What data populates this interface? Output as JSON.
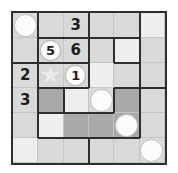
{
  "puzzle": {
    "title": "6x6 region grid puzzle",
    "columns": 6,
    "rows": 6,
    "cell_size": 26,
    "colors": {
      "border": "#2e2e2e",
      "gridline": "#c5c5c5",
      "cell_light": "#d9d9d9",
      "cell_pale": "#eeeeee",
      "cell_dark": "#a9a9a9",
      "piece": "#fbfbfb",
      "text": "#1d1d1d"
    },
    "cells": [
      {
        "r": 1,
        "c": 1,
        "fill": "light",
        "piece": "stone",
        "value": ""
      },
      {
        "r": 1,
        "c": 2,
        "fill": "light",
        "piece": "none",
        "value": ""
      },
      {
        "r": 1,
        "c": 3,
        "fill": "light",
        "piece": "none",
        "value": "3"
      },
      {
        "r": 1,
        "c": 4,
        "fill": "light",
        "piece": "none",
        "value": ""
      },
      {
        "r": 1,
        "c": 5,
        "fill": "light",
        "piece": "none",
        "value": ""
      },
      {
        "r": 1,
        "c": 6,
        "fill": "pale",
        "piece": "none",
        "value": ""
      },
      {
        "r": 2,
        "c": 1,
        "fill": "light",
        "piece": "none",
        "value": ""
      },
      {
        "r": 2,
        "c": 2,
        "fill": "light",
        "piece": "circle-number",
        "value": "5"
      },
      {
        "r": 2,
        "c": 3,
        "fill": "light",
        "piece": "none",
        "value": "6"
      },
      {
        "r": 2,
        "c": 4,
        "fill": "light",
        "piece": "none",
        "value": ""
      },
      {
        "r": 2,
        "c": 5,
        "fill": "pale",
        "piece": "none",
        "value": ""
      },
      {
        "r": 2,
        "c": 6,
        "fill": "light",
        "piece": "none",
        "value": ""
      },
      {
        "r": 3,
        "c": 1,
        "fill": "light",
        "piece": "none",
        "value": "2"
      },
      {
        "r": 3,
        "c": 2,
        "fill": "light",
        "piece": "star",
        "value": ""
      },
      {
        "r": 3,
        "c": 3,
        "fill": "light",
        "piece": "circle-number",
        "value": "1"
      },
      {
        "r": 3,
        "c": 4,
        "fill": "pale",
        "piece": "none",
        "value": ""
      },
      {
        "r": 3,
        "c": 5,
        "fill": "light",
        "piece": "none",
        "value": ""
      },
      {
        "r": 3,
        "c": 6,
        "fill": "light",
        "piece": "none",
        "value": ""
      },
      {
        "r": 4,
        "c": 1,
        "fill": "light",
        "piece": "none",
        "value": "3"
      },
      {
        "r": 4,
        "c": 2,
        "fill": "dark",
        "piece": "none",
        "value": ""
      },
      {
        "r": 4,
        "c": 3,
        "fill": "pale",
        "piece": "none",
        "value": ""
      },
      {
        "r": 4,
        "c": 4,
        "fill": "light",
        "piece": "stone",
        "value": ""
      },
      {
        "r": 4,
        "c": 5,
        "fill": "dark",
        "piece": "none",
        "value": ""
      },
      {
        "r": 4,
        "c": 6,
        "fill": "light",
        "piece": "none",
        "value": ""
      },
      {
        "r": 5,
        "c": 1,
        "fill": "light",
        "piece": "none",
        "value": ""
      },
      {
        "r": 5,
        "c": 2,
        "fill": "pale",
        "piece": "none",
        "value": ""
      },
      {
        "r": 5,
        "c": 3,
        "fill": "dark",
        "piece": "none",
        "value": ""
      },
      {
        "r": 5,
        "c": 4,
        "fill": "dark",
        "piece": "none",
        "value": ""
      },
      {
        "r": 5,
        "c": 5,
        "fill": "dark",
        "piece": "stone",
        "value": ""
      },
      {
        "r": 5,
        "c": 6,
        "fill": "light",
        "piece": "none",
        "value": ""
      },
      {
        "r": 6,
        "c": 1,
        "fill": "pale",
        "piece": "none",
        "value": ""
      },
      {
        "r": 6,
        "c": 2,
        "fill": "light",
        "piece": "none",
        "value": ""
      },
      {
        "r": 6,
        "c": 3,
        "fill": "light",
        "piece": "none",
        "value": ""
      },
      {
        "r": 6,
        "c": 4,
        "fill": "light",
        "piece": "none",
        "value": ""
      },
      {
        "r": 6,
        "c": 5,
        "fill": "light",
        "piece": "none",
        "value": ""
      },
      {
        "r": 6,
        "c": 6,
        "fill": "light",
        "piece": "stone",
        "value": ""
      }
    ],
    "clues": [
      {
        "value": "3",
        "row": 1,
        "col": 3,
        "style": "plain"
      },
      {
        "value": "5",
        "row": 2,
        "col": 2,
        "style": "circled"
      },
      {
        "value": "6",
        "row": 2,
        "col": 3,
        "style": "plain"
      },
      {
        "value": "2",
        "row": 3,
        "col": 1,
        "style": "plain"
      },
      {
        "value": "1",
        "row": 3,
        "col": 3,
        "style": "circled"
      },
      {
        "value": "3",
        "row": 4,
        "col": 1,
        "style": "plain"
      }
    ],
    "region_edges_horizontal": [
      {
        "row_boundary": 1,
        "col_start": 2,
        "col_end": 3
      },
      {
        "row_boundary": 1,
        "col_start": 4,
        "col_end": 5
      },
      {
        "row_boundary": 2,
        "col_start": 3,
        "col_end": 3
      },
      {
        "row_boundary": 2,
        "col_start": 5,
        "col_end": 5
      },
      {
        "row_boundary": 3,
        "col_start": 5,
        "col_end": 5
      },
      {
        "row_boundary": 3,
        "col_start": 2,
        "col_end": 2
      },
      {
        "row_boundary": 4,
        "col_start": 3,
        "col_end": 3
      },
      {
        "row_boundary": 4,
        "col_start": 2,
        "col_end": 2
      },
      {
        "row_boundary": 5,
        "col_start": 2,
        "col_end": 5
      },
      {
        "row_boundary": 2,
        "col_start": 1,
        "col_end": 2
      }
    ],
    "region_edges_vertical": [
      {
        "col_boundary": 1,
        "row_start": 3,
        "row_end": 5
      },
      {
        "col_boundary": 5,
        "row_boundary_note": "right block",
        "row_start": 1,
        "row_end": 1
      },
      {
        "col_boundary": 4,
        "row_start": 2,
        "row_end": 2
      },
      {
        "col_boundary": 5,
        "row_start": 2,
        "row_end": 2
      },
      {
        "col_boundary": 5,
        "row_start": 3,
        "row_end": 5
      },
      {
        "col_boundary": 3,
        "row_start": 1,
        "row_end": 2
      },
      {
        "col_boundary": 1,
        "row_start": 2,
        "row_end": 2
      },
      {
        "col_boundary": 2,
        "row_start": 4,
        "row_end": 4
      },
      {
        "col_boundary": 3,
        "row_start": 4,
        "row_end": 4
      },
      {
        "col_boundary": 4,
        "row_start": 4,
        "row_end": 4
      },
      {
        "col_boundary": 1,
        "row_start": 5,
        "row_end": 5
      },
      {
        "col_boundary": 3,
        "row_start": 6,
        "row_end": 6
      }
    ]
  }
}
